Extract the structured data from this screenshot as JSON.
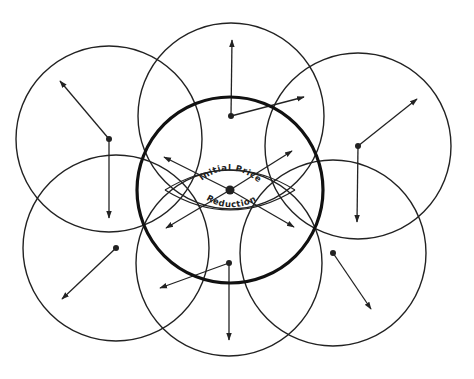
{
  "diagram": {
    "type": "overlapping-circles-vector-diagram",
    "center_labels": {
      "upper": "Initial Price",
      "lower": "Reduction"
    },
    "colors": {
      "stroke": "#222222",
      "background": "#ffffff"
    },
    "radius": 93,
    "central_circle": {
      "cx": 230,
      "cy": 190,
      "r": 93,
      "emphasis": "thick",
      "arrows": [
        {
          "x": 164,
          "y": 157
        },
        {
          "x": 292,
          "y": 151
        },
        {
          "x": 166,
          "y": 228
        },
        {
          "x": 294,
          "y": 227
        }
      ]
    },
    "outer_circles": [
      {
        "name": "top-left",
        "cx": 109,
        "cy": 139,
        "arrows": [
          {
            "x": 60,
            "y": 81
          },
          {
            "x": 109,
            "y": 218
          }
        ]
      },
      {
        "name": "top",
        "cx": 231,
        "cy": 116,
        "arrows": [
          {
            "x": 232,
            "y": 40
          },
          {
            "x": 304,
            "y": 97
          }
        ]
      },
      {
        "name": "top-right",
        "cx": 358,
        "cy": 146,
        "arrows": [
          {
            "x": 417,
            "y": 99
          },
          {
            "x": 357,
            "y": 222
          }
        ]
      },
      {
        "name": "bottom-left",
        "cx": 116,
        "cy": 248,
        "arrows": [
          {
            "x": 62,
            "y": 299
          }
        ]
      },
      {
        "name": "bottom-center",
        "cx": 229,
        "cy": 263,
        "arrows": [
          {
            "x": 160,
            "y": 288
          },
          {
            "x": 229,
            "y": 340
          }
        ]
      },
      {
        "name": "bottom-right",
        "cx": 333,
        "cy": 253,
        "arrows": [
          {
            "x": 371,
            "y": 309
          }
        ]
      }
    ]
  }
}
